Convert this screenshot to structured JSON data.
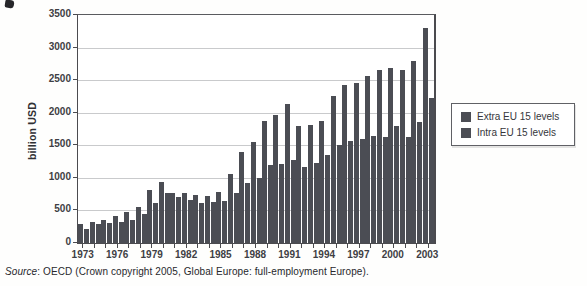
{
  "colors": {
    "bar": "#4b4d54",
    "grid": "#c9cacc",
    "axis": "#4b4b4f",
    "text": "#3e3f44"
  },
  "chart_data": {
    "type": "bar",
    "title": "",
    "ylabel": "billion USD",
    "xlabel": "",
    "ylim": [
      0,
      3500
    ],
    "ytick_step": 500,
    "yticks": [
      0,
      500,
      1000,
      1500,
      2000,
      2500,
      3000,
      3500
    ],
    "grid": true,
    "legend_position": "right",
    "categories": [
      1973,
      1974,
      1975,
      1976,
      1977,
      1978,
      1979,
      1980,
      1981,
      1982,
      1983,
      1984,
      1985,
      1986,
      1987,
      1988,
      1989,
      1990,
      1991,
      1992,
      1993,
      1994,
      1995,
      1996,
      1997,
      1998,
      1999,
      2000,
      2001,
      2002,
      2003
    ],
    "xtick_labels": [
      "1973",
      "1976",
      "1979",
      "1982",
      "1985",
      "1988",
      "1991",
      "1994",
      "1997",
      "2000",
      "2003"
    ],
    "series": [
      {
        "name": "Extra EU 15 levels",
        "color": "#4b4d54",
        "values": [
          290,
          330,
          360,
          420,
          470,
          545,
          810,
          930,
          760,
          770,
          730,
          715,
          790,
          1060,
          1400,
          1550,
          1870,
          1960,
          2130,
          1790,
          1815,
          1880,
          2250,
          2430,
          2450,
          2560,
          2660,
          2680,
          2660,
          2800,
          3300
        ]
      },
      {
        "name": "Intra EU 15 levels",
        "color": "#4b4d54",
        "values": [
          210,
          290,
          300,
          330,
          360,
          440,
          620,
          760,
          700,
          660,
          620,
          635,
          650,
          760,
          920,
          1000,
          1190,
          1220,
          1280,
          1160,
          1230,
          1350,
          1500,
          1560,
          1600,
          1650,
          1630,
          1800,
          1620,
          1850,
          2230
        ]
      }
    ]
  },
  "legend": {
    "items": [
      {
        "label": "Extra EU 15 levels",
        "color": "#4b4d54"
      },
      {
        "label": "Intra EU 15 levels",
        "color": "#4b4d54"
      }
    ]
  },
  "source_note": {
    "prefix": "Source",
    "rest": ": OECD (Crown copyright 2005, Global Europe: full-employment Europe)."
  }
}
